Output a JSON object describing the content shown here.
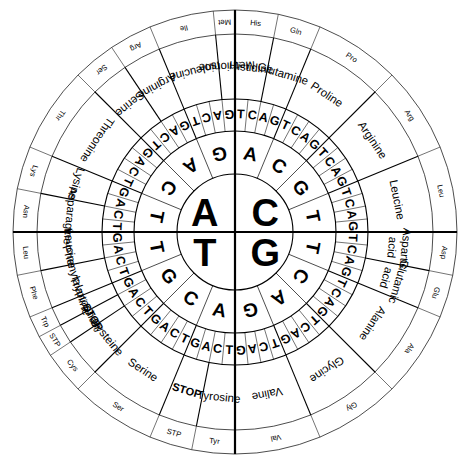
{
  "diagram": {
    "geometry": {
      "center_x": 235,
      "center_y": 232,
      "r_center": 58,
      "r_ring2": 101,
      "r_ring3": 133,
      "r_ring4": 198,
      "r_ring5": 222,
      "start_angle_deg": -90
    },
    "ring_labels": {
      "ring1": "first base",
      "ring2": "second base",
      "ring3": "third base",
      "ring4": "amino acid",
      "ring5": "abbreviation"
    }
  },
  "first_base": {
    "order_clockwise": [
      "C",
      "G",
      "T",
      "A"
    ],
    "quadrants": [
      {
        "letter": "A",
        "position": "top-left"
      },
      {
        "letter": "C",
        "position": "top-right"
      },
      {
        "letter": "G",
        "position": "bottom-right"
      },
      {
        "letter": "T",
        "position": "bottom-left"
      }
    ]
  },
  "second_base": {
    "sequence_clockwise_from_top": [
      "A",
      "C",
      "G",
      "T",
      "T",
      "C",
      "A",
      "G",
      "A",
      "C",
      "G",
      "T",
      "T",
      "C",
      "A",
      "G"
    ]
  },
  "third_base": {
    "pattern_clockwise": [
      "T",
      "C",
      "A",
      "G"
    ],
    "sequence_clockwise_from_top": [
      "T",
      "C",
      "A",
      "G",
      "T",
      "C",
      "A",
      "G",
      "T",
      "C",
      "A",
      "G",
      "T",
      "C",
      "A",
      "G",
      "T",
      "C",
      "A",
      "G",
      "T",
      "C",
      "A",
      "G",
      "T",
      "C",
      "A",
      "G",
      "T",
      "C",
      "A",
      "G",
      "T",
      "C",
      "A",
      "G",
      "T",
      "C",
      "A",
      "G",
      "T",
      "C",
      "A",
      "G",
      "T",
      "C",
      "A",
      "G",
      "T",
      "C",
      "A",
      "G",
      "T",
      "C",
      "A",
      "G",
      "T",
      "C",
      "A",
      "G",
      "T",
      "C",
      "A",
      "G"
    ]
  },
  "amino_acids": [
    {
      "name": "Histidine",
      "abbr": "His",
      "codons": 2,
      "start_index": 0
    },
    {
      "name": "Glutamine",
      "abbr": "Gln",
      "codons": 2,
      "start_index": 2
    },
    {
      "name": "Proline",
      "abbr": "Pro",
      "codons": 4,
      "start_index": 4
    },
    {
      "name": "Arginine",
      "abbr": "Arg",
      "codons": 4,
      "start_index": 8
    },
    {
      "name": "Leucine",
      "abbr": "Leu",
      "codons": 4,
      "start_index": 12
    },
    {
      "name": "Aspartic acid",
      "abbr": "Asp",
      "codons": 2,
      "start_index": 16
    },
    {
      "name": "Glutamic acid",
      "abbr": "Glu",
      "codons": 2,
      "start_index": 18
    },
    {
      "name": "Alanine",
      "abbr": "Ala",
      "codons": 4,
      "start_index": 20
    },
    {
      "name": "Glycine",
      "abbr": "Gly",
      "codons": 4,
      "start_index": 24
    },
    {
      "name": "Valine",
      "abbr": "Val",
      "codons": 4,
      "start_index": 28
    },
    {
      "name": "Tyrosine",
      "abbr": "Tyr",
      "codons": 2,
      "start_index": 32
    },
    {
      "name": "STOP",
      "abbr": "STP",
      "codons": 2,
      "start_index": 34
    },
    {
      "name": "Serine",
      "abbr": "Ser",
      "codons": 4,
      "start_index": 36
    },
    {
      "name": "Cysteine",
      "abbr": "Cys",
      "codons": 2,
      "start_index": 40
    },
    {
      "name": "STOP",
      "abbr": "STP",
      "codons": 1,
      "start_index": 42
    },
    {
      "name": "Tryptophan",
      "abbr": "Trp",
      "codons": 1,
      "start_index": 43
    },
    {
      "name": "Phenylalanine",
      "abbr": "Phe",
      "codons": 2,
      "start_index": 44
    },
    {
      "name": "Leucine",
      "abbr": "Leu",
      "codons": 2,
      "start_index": 46
    },
    {
      "name": "Asparagine",
      "abbr": "Asn",
      "codons": 2,
      "start_index": 48
    },
    {
      "name": "Lysine",
      "abbr": "Lys",
      "codons": 2,
      "start_index": 50
    },
    {
      "name": "Threonine",
      "abbr": "Thr",
      "codons": 4,
      "start_index": 52
    },
    {
      "name": "Serine",
      "abbr": "Ser",
      "codons": 2,
      "start_index": 56
    },
    {
      "name": "Arginine",
      "abbr": "Arg",
      "codons": 2,
      "start_index": 58
    },
    {
      "name": "Isoleucine",
      "abbr": "Ile",
      "codons": 3,
      "start_index": 60
    },
    {
      "name": "Methionine",
      "abbr": "Met",
      "codons": 1,
      "start_index": 63
    }
  ],
  "colors": {
    "stroke": "#000000",
    "background": "#ffffff",
    "text": "#000000"
  }
}
